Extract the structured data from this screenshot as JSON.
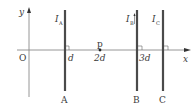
{
  "diagram": {
    "type": "physics-wires-on-axis",
    "axes": {
      "x_label": "x",
      "y_label": "y",
      "origin_label": "O"
    },
    "point": {
      "label": "p",
      "position_label": "2d"
    },
    "wires": [
      {
        "name": "A",
        "current_label": "I",
        "current_sub": "A",
        "position_label": "d",
        "has_arrow": false
      },
      {
        "name": "B",
        "current_label": "I",
        "current_sub": "B",
        "position_label": "3d",
        "has_arrow": true
      },
      {
        "name": "C",
        "current_label": "I",
        "current_sub": "C",
        "position_label": "",
        "has_arrow": false
      }
    ],
    "colors": {
      "wire": "#4a4a4a",
      "axis": "#8a8a8a",
      "text": "#3a3a3a"
    }
  }
}
